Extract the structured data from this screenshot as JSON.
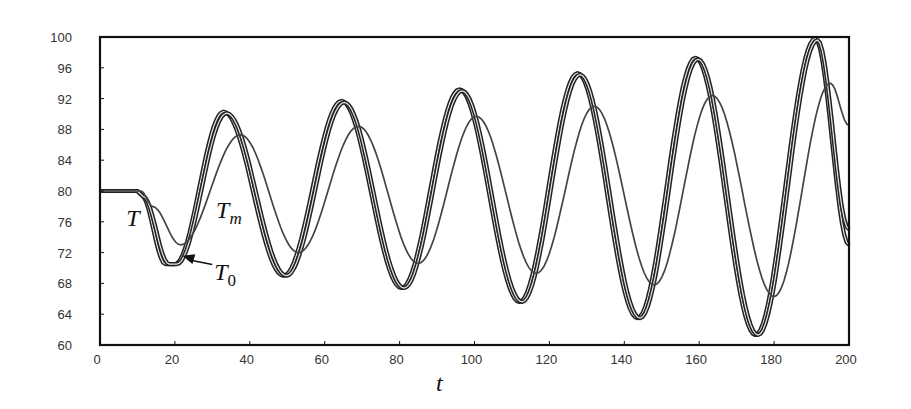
{
  "chart_data": {
    "type": "line",
    "title": "",
    "xlabel": "t",
    "ylabel": "",
    "xlim": [
      0,
      200
    ],
    "ylim": [
      60,
      100
    ],
    "x_ticks": [
      0,
      20,
      40,
      60,
      80,
      100,
      120,
      140,
      160,
      180,
      200
    ],
    "y_ticks": [
      60,
      64,
      68,
      72,
      76,
      80,
      84,
      88,
      92,
      96,
      100
    ],
    "grid": false,
    "legend": "none (inline annotations)",
    "annotations": [
      {
        "text": "T",
        "sub": "",
        "x": 7,
        "y": 75.5
      },
      {
        "text": "T",
        "sub": "m",
        "x": 31,
        "y": 76.5
      },
      {
        "text": "T",
        "sub": "0",
        "x": 30.5,
        "y": 68.5,
        "arrow_to": {
          "x": 22,
          "y": 71.6
        }
      }
    ],
    "series": [
      {
        "name": "T",
        "style": "thick",
        "points": [
          [
            0,
            80
          ],
          [
            10,
            80
          ],
          [
            11,
            79.5
          ],
          [
            17.5,
            70.5
          ],
          [
            20,
            70.5
          ],
          [
            33,
            90.3
          ],
          [
            49,
            69
          ],
          [
            64.5,
            91.7
          ],
          [
            80.5,
            67.4
          ],
          [
            96,
            93.2
          ],
          [
            112,
            65.6
          ],
          [
            127.5,
            95.3
          ],
          [
            143.5,
            63.5
          ],
          [
            159,
            97.3
          ],
          [
            175,
            61.3
          ],
          [
            191,
            99.8
          ],
          [
            200,
            73
          ]
        ]
      },
      {
        "name": "T0",
        "style": "thick",
        "points": [
          [
            0,
            80
          ],
          [
            10,
            80
          ],
          [
            11.5,
            79.3
          ],
          [
            18.5,
            70.5
          ],
          [
            20.5,
            70.5
          ],
          [
            33.8,
            90.1
          ],
          [
            49.8,
            69
          ],
          [
            65.2,
            91.5
          ],
          [
            81.2,
            67.4
          ],
          [
            96.7,
            93
          ],
          [
            112.7,
            65.6
          ],
          [
            128.2,
            95.1
          ],
          [
            144.2,
            63.5
          ],
          [
            159.7,
            97.1
          ],
          [
            175.7,
            61.3
          ],
          [
            191.6,
            99.6
          ],
          [
            200,
            75
          ]
        ]
      },
      {
        "name": "Tm",
        "style": "thin",
        "points": [
          [
            0,
            80
          ],
          [
            11,
            80
          ],
          [
            14,
            78
          ],
          [
            21.5,
            73
          ],
          [
            37.5,
            87.3
          ],
          [
            53,
            72
          ],
          [
            69,
            88.4
          ],
          [
            85,
            70.6
          ],
          [
            100.5,
            89.7
          ],
          [
            116.5,
            69.3
          ],
          [
            132,
            91
          ],
          [
            148,
            67.8
          ],
          [
            163.5,
            92.4
          ],
          [
            180,
            66.3
          ],
          [
            195,
            94
          ],
          [
            200,
            88.5
          ]
        ]
      }
    ]
  },
  "labels": {
    "x_axis": "t",
    "ann_T": "T",
    "ann_Tm_main": "T",
    "ann_Tm_sub": "m",
    "ann_T0_main": "T",
    "ann_T0_sub": "0"
  }
}
